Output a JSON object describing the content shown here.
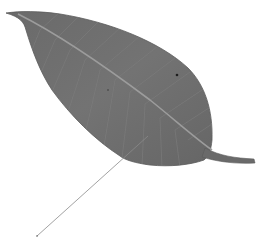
{
  "image": {
    "subject": "leaf",
    "description": "Single grey elongated leaf with pointed tip at upper left and petiole at lower right; a thin pointer line extends from the lower edge of the leaf down to the lower left.",
    "colors": {
      "background": "#ffffff",
      "leaf_fill": "#6f6f6f",
      "leaf_edge": "#5a5a5a",
      "midrib": "#9a9a9a",
      "veins": "#7c7c7c",
      "pointer_line": "#8a8a8a",
      "spot": "#1e1e1e"
    },
    "pointer": {
      "start": [
        37,
        236
      ],
      "end": [
        148,
        136
      ]
    }
  }
}
